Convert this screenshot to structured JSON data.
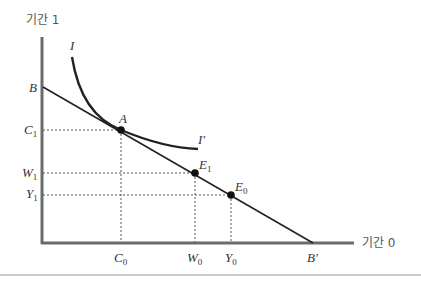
{
  "diagram": {
    "y_axis_label": "기간 1",
    "x_axis_label": "기간 0",
    "curves": {
      "indifference_start_label": "I",
      "indifference_end_label": "I′"
    },
    "points": {
      "A": "A",
      "E1": "E",
      "E1_sub": "1",
      "E0": "E",
      "E0_sub": "0"
    },
    "y_ticks": {
      "B": "B",
      "C1": "C",
      "C1_sub": "1",
      "W1": "W",
      "W1_sub": "1",
      "Y1": "Y",
      "Y1_sub": "1"
    },
    "x_ticks": {
      "C0": "C",
      "C0_sub": "0",
      "W0": "W",
      "W0_sub": "0",
      "Y0": "Y",
      "Y0_sub": "0",
      "Bprime": "B′"
    },
    "colors": {
      "axis": "#6b6b6b",
      "line": "#222222",
      "dash": "#555555",
      "rule": "#999999"
    }
  }
}
